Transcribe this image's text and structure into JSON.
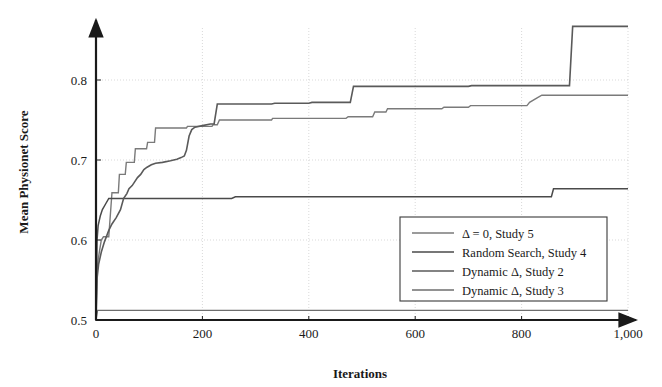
{
  "figure": {
    "background": "#ffffff",
    "axis_color": "#1a1a1a",
    "grid_color": "#c8c8c8"
  },
  "chart_data": {
    "type": "line",
    "title": "",
    "xlabel": "Iterations",
    "ylabel": "Mean Physionet Score",
    "xlim": [
      0,
      1000
    ],
    "ylim": [
      0.5,
      0.88
    ],
    "xticks": [
      0,
      200,
      400,
      600,
      800,
      1000
    ],
    "xtick_labels": [
      "0",
      "200",
      "400",
      "600",
      "800",
      "1,000"
    ],
    "yticks": [
      0.5,
      0.6,
      0.7,
      0.8
    ],
    "ytick_labels": [
      "0.5",
      "0.6",
      "0.7",
      "0.8"
    ],
    "grid": true,
    "legend_position": "lower right",
    "series": [
      {
        "name": "Δ = 0, Study 5",
        "color": "#7a7a7a",
        "width": 1.4,
        "points": [
          [
            0,
            0.5
          ],
          [
            2,
            0.56
          ],
          [
            4,
            0.575
          ],
          [
            7,
            0.588
          ],
          [
            10,
            0.6
          ],
          [
            14,
            0.604
          ],
          [
            22,
            0.604
          ],
          [
            24,
            0.604
          ],
          [
            30,
            0.659
          ],
          [
            42,
            0.659
          ],
          [
            44,
            0.682
          ],
          [
            55,
            0.682
          ],
          [
            57,
            0.697
          ],
          [
            72,
            0.697
          ],
          [
            74,
            0.714
          ],
          [
            95,
            0.714
          ],
          [
            97,
            0.722
          ],
          [
            110,
            0.722
          ],
          [
            112,
            0.74
          ],
          [
            170,
            0.74
          ],
          [
            172,
            0.742
          ],
          [
            218,
            0.742
          ],
          [
            220,
            0.744
          ],
          [
            228,
            0.744
          ],
          [
            232,
            0.75
          ],
          [
            330,
            0.75
          ],
          [
            332,
            0.752
          ],
          [
            470,
            0.752
          ],
          [
            474,
            0.754
          ],
          [
            520,
            0.754
          ],
          [
            524,
            0.76
          ],
          [
            545,
            0.76
          ],
          [
            548,
            0.764
          ],
          [
            650,
            0.764
          ],
          [
            654,
            0.766
          ],
          [
            700,
            0.766
          ],
          [
            704,
            0.768
          ],
          [
            810,
            0.768
          ],
          [
            815,
            0.772
          ],
          [
            830,
            0.778
          ],
          [
            838,
            0.781
          ],
          [
            1000,
            0.781
          ]
        ]
      },
      {
        "name": "Random Search, Study 4",
        "color": "#4a4a4a",
        "width": 1.5,
        "points": [
          [
            0,
            0.5
          ],
          [
            2,
            0.6
          ],
          [
            4,
            0.618
          ],
          [
            8,
            0.63
          ],
          [
            12,
            0.638
          ],
          [
            18,
            0.645
          ],
          [
            24,
            0.652
          ],
          [
            30,
            0.652
          ],
          [
            255,
            0.652
          ],
          [
            262,
            0.654
          ],
          [
            856,
            0.654
          ],
          [
            860,
            0.664
          ],
          [
            1000,
            0.664
          ]
        ]
      },
      {
        "name": "Dynamic Δ, Study 2",
        "color": "#5a5a5a",
        "width": 1.6,
        "points": [
          [
            0,
            0.5
          ],
          [
            2,
            0.552
          ],
          [
            5,
            0.57
          ],
          [
            10,
            0.585
          ],
          [
            16,
            0.598
          ],
          [
            24,
            0.612
          ],
          [
            30,
            0.62
          ],
          [
            38,
            0.628
          ],
          [
            46,
            0.638
          ],
          [
            52,
            0.652
          ],
          [
            58,
            0.658
          ],
          [
            62,
            0.664
          ],
          [
            68,
            0.668
          ],
          [
            72,
            0.672
          ],
          [
            78,
            0.678
          ],
          [
            84,
            0.682
          ],
          [
            90,
            0.688
          ],
          [
            96,
            0.691
          ],
          [
            104,
            0.694
          ],
          [
            112,
            0.696
          ],
          [
            125,
            0.697
          ],
          [
            140,
            0.699
          ],
          [
            152,
            0.701
          ],
          [
            160,
            0.703
          ],
          [
            166,
            0.705
          ],
          [
            170,
            0.712
          ],
          [
            175,
            0.73
          ],
          [
            180,
            0.738
          ],
          [
            186,
            0.741
          ],
          [
            200,
            0.743
          ],
          [
            215,
            0.745
          ],
          [
            222,
            0.745
          ],
          [
            228,
            0.77
          ],
          [
            330,
            0.77
          ],
          [
            336,
            0.771
          ],
          [
            400,
            0.771
          ],
          [
            406,
            0.772
          ],
          [
            478,
            0.772
          ],
          [
            484,
            0.792
          ],
          [
            700,
            0.792
          ],
          [
            706,
            0.793
          ],
          [
            860,
            0.793
          ],
          [
            866,
            0.793
          ],
          [
            890,
            0.793
          ],
          [
            896,
            0.867
          ],
          [
            1000,
            0.867
          ]
        ]
      },
      {
        "name": "Dynamic Δ, Study 3",
        "color": "#6e6e6e",
        "width": 1.3,
        "points": [
          [
            0,
            0.5
          ],
          [
            3,
            0.512
          ],
          [
            1000,
            0.512
          ]
        ]
      }
    ]
  }
}
